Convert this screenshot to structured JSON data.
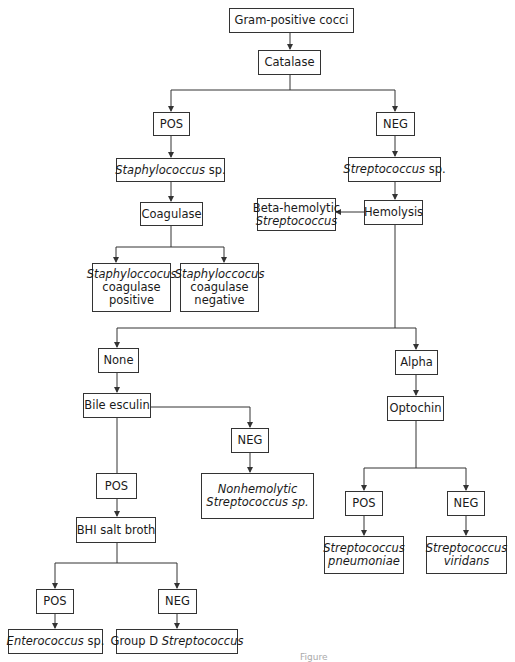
{
  "diagram": {
    "colors": {
      "line": "#333333",
      "box_border": "#333333",
      "text": "#1a1a1a",
      "background": "#ffffff"
    },
    "nodes": {
      "root": {
        "lines": [
          "Gram-positive cocci"
        ]
      },
      "catalase": {
        "lines": [
          "Catalase"
        ]
      },
      "catalase_pos": {
        "lines": [
          "POS"
        ]
      },
      "catalase_neg": {
        "lines": [
          "NEG"
        ]
      },
      "staph": {
        "lines": [
          "Staphylococcus",
          " sp."
        ]
      },
      "strep": {
        "lines": [
          "Streptococcus",
          " sp."
        ]
      },
      "coagulase": {
        "lines": [
          "Coagulase"
        ]
      },
      "hemolysis": {
        "lines": [
          "Hemolysis"
        ]
      },
      "beta": {
        "lines": [
          "Beta-hemolytic",
          "Streptococcus"
        ]
      },
      "staph_pos": {
        "lines": [
          "Staphyloccocus",
          "coagulase",
          "positive"
        ]
      },
      "staph_neg": {
        "lines": [
          "Staphyloccocus",
          "coagulase",
          "negative"
        ]
      },
      "none": {
        "lines": [
          "None"
        ]
      },
      "alpha": {
        "lines": [
          "Alpha"
        ]
      },
      "bile": {
        "lines": [
          "Bile esculin"
        ]
      },
      "bile_neg": {
        "lines": [
          "NEG"
        ]
      },
      "optochin": {
        "lines": [
          "Optochin"
        ]
      },
      "nonhemolytic": {
        "lines": [
          "Nonhemolytic",
          "Streptococcus sp."
        ]
      },
      "bile_pos": {
        "lines": [
          "POS"
        ]
      },
      "opto_pos": {
        "lines": [
          "POS"
        ]
      },
      "opto_neg": {
        "lines": [
          "NEG"
        ]
      },
      "pneumoniae": {
        "lines": [
          "Streptococcus",
          "pneumoniae"
        ]
      },
      "viridans": {
        "lines": [
          "Streptococcus",
          "viridans"
        ]
      },
      "bhi": {
        "lines": [
          "BHI salt broth"
        ]
      },
      "bhi_pos": {
        "lines": [
          "POS"
        ]
      },
      "bhi_neg": {
        "lines": [
          "NEG"
        ]
      },
      "enterococcus": {
        "lines": [
          "Enterococcus",
          " sp."
        ]
      },
      "groupd": {
        "lines": [
          "Group D ",
          "Streptococcus"
        ]
      }
    },
    "caption": "Figure"
  }
}
